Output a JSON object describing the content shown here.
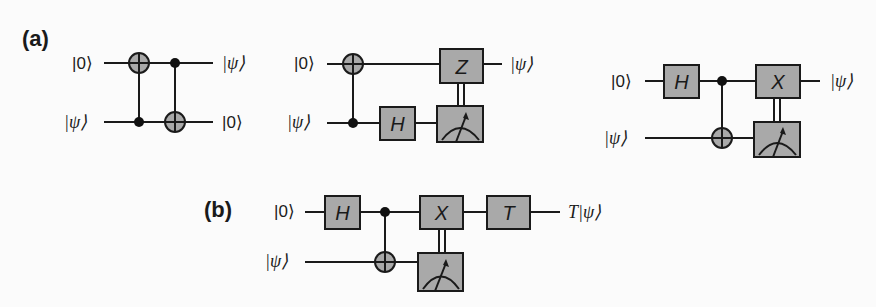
{
  "figure": {
    "panels": [
      {
        "label": "(a)",
        "circuits": [
          {
            "id": "swap-teleport",
            "inputs": [
              "|0⟩",
              "|ψ⟩"
            ],
            "outputs": [
              "|ψ⟩",
              "|0⟩"
            ],
            "gates": [
              {
                "type": "CNOT",
                "control": 1,
                "target": 0
              },
              {
                "type": "CNOT",
                "control": 0,
                "target": 1
              }
            ]
          },
          {
            "id": "z-correction",
            "inputs": [
              "|0⟩",
              "|ψ⟩"
            ],
            "outputs": [
              "|ψ⟩"
            ],
            "gates": [
              {
                "type": "CNOT",
                "control": 1,
                "target": 0
              },
              {
                "type": "H",
                "qubit": 1,
                "label": "H"
              },
              {
                "type": "Measure",
                "qubit": 1
              },
              {
                "type": "Classically-controlled",
                "qubit": 0,
                "label": "Z"
              }
            ]
          },
          {
            "id": "x-correction",
            "inputs": [
              "|0⟩",
              "|ψ⟩"
            ],
            "outputs": [
              "|ψ⟩"
            ],
            "gates": [
              {
                "type": "H",
                "qubit": 0,
                "label": "H"
              },
              {
                "type": "CNOT",
                "control": 0,
                "target": 1
              },
              {
                "type": "Measure",
                "qubit": 1
              },
              {
                "type": "Classically-controlled",
                "qubit": 0,
                "label": "X"
              }
            ]
          }
        ]
      },
      {
        "label": "(b)",
        "circuits": [
          {
            "id": "t-gate-teleport",
            "inputs": [
              "|0⟩",
              "|ψ⟩"
            ],
            "outputs": [
              "T|ψ⟩"
            ],
            "gates": [
              {
                "type": "H",
                "qubit": 0,
                "label": "H"
              },
              {
                "type": "CNOT",
                "control": 0,
                "target": 1
              },
              {
                "type": "Measure",
                "qubit": 1
              },
              {
                "type": "Classically-controlled",
                "qubit": 0,
                "label": "X"
              },
              {
                "type": "T",
                "qubit": 0,
                "label": "T"
              }
            ]
          }
        ]
      }
    ]
  },
  "labels": {
    "panel_a": "(a)",
    "panel_b": "(b)",
    "ket0": "|0⟩",
    "ketpsi": "|ψ⟩",
    "out_t_psi": "T|ψ⟩",
    "gate_h": "H",
    "gate_z": "Z",
    "gate_x": "X",
    "gate_t": "T"
  },
  "colors": {
    "gate_fill": "#a9a9a9",
    "line": "#1a1a1a",
    "background": "#fbfbfb"
  }
}
